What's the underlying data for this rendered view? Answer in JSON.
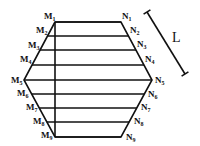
{
  "diagram": {
    "type": "hexagon-slicing",
    "hexagon": {
      "vertices": {
        "top_left": [
          55,
          22
        ],
        "left": [
          24,
          80
        ],
        "bottom_left": [
          55,
          137
        ],
        "bottom_right": [
          121,
          137
        ],
        "right": [
          152,
          80
        ],
        "top_right": [
          121,
          22
        ]
      }
    },
    "vertical_line_x": 55,
    "left_labels": [
      {
        "letter": "M",
        "sub": "1",
        "x": 44,
        "y": 19
      },
      {
        "letter": "M",
        "sub": "2",
        "x": 36,
        "y": 33
      },
      {
        "letter": "M",
        "sub": "3",
        "x": 28,
        "y": 48
      },
      {
        "letter": "M",
        "sub": "4",
        "x": 20,
        "y": 62
      },
      {
        "letter": "M",
        "sub": "5",
        "x": 11,
        "y": 83
      },
      {
        "letter": "M",
        "sub": "6",
        "x": 17,
        "y": 96
      },
      {
        "letter": "M",
        "sub": "7",
        "x": 26,
        "y": 110
      },
      {
        "letter": "M",
        "sub": "8",
        "x": 33,
        "y": 124
      },
      {
        "letter": "M",
        "sub": "9",
        "x": 41,
        "y": 138
      }
    ],
    "right_labels": [
      {
        "letter": "N",
        "sub": "1",
        "x": 122,
        "y": 19
      },
      {
        "letter": "N",
        "sub": "2",
        "x": 130,
        "y": 33
      },
      {
        "letter": "N",
        "sub": "3",
        "x": 137,
        "y": 47
      },
      {
        "letter": "N",
        "sub": "4",
        "x": 145,
        "y": 62
      },
      {
        "letter": "N",
        "sub": "5",
        "x": 155,
        "y": 83
      },
      {
        "letter": "N",
        "sub": "6",
        "x": 148,
        "y": 97
      },
      {
        "letter": "N",
        "sub": "7",
        "x": 141,
        "y": 110
      },
      {
        "letter": "N",
        "sub": "8",
        "x": 134,
        "y": 124
      },
      {
        "letter": "N",
        "sub": "9",
        "x": 126,
        "y": 140
      }
    ],
    "rows_y": [
      22,
      36,
      50,
      65,
      80,
      94,
      108,
      122,
      137
    ],
    "dimension": {
      "label": "L",
      "start": [
        147,
        12
      ],
      "end": [
        185,
        74
      ],
      "label_pos": [
        172,
        42
      ]
    }
  }
}
